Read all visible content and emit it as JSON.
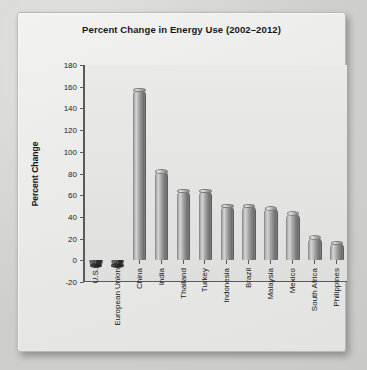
{
  "chart_data": {
    "type": "bar",
    "title": "Percent Change in Energy Use (2002–2012)",
    "xlabel": "",
    "ylabel": "Percent Change",
    "ylim": [
      -20,
      180
    ],
    "ytick_step": 20,
    "yticks": [
      180,
      160,
      140,
      120,
      100,
      80,
      60,
      40,
      20,
      0,
      -20
    ],
    "grid": false,
    "legend": null,
    "categories": [
      "U.S.",
      "European Union",
      "China",
      "India",
      "Thailand",
      "Turkey",
      "Indonesia",
      "Brazil",
      "Malaysia",
      "Mexico",
      "South Africa",
      "Philippines"
    ],
    "values": [
      -5,
      -5,
      157,
      82,
      64,
      64,
      50,
      50,
      48,
      43,
      21,
      16
    ]
  },
  "style": {
    "bar_color": "#9a9a9a",
    "panel_background": "#ebebe9",
    "axis_color": "#5a5a5c",
    "text_color": "#17171a"
  }
}
